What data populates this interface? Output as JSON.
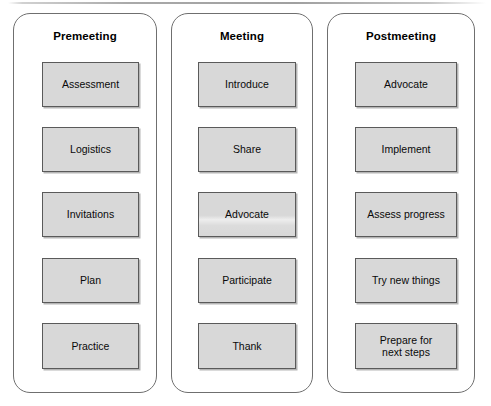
{
  "diagram": {
    "accent_color": "#d8d8d8",
    "border_color": "#5a5a5a",
    "panel_border_color": "#6f6f6f",
    "background_color": "#ffffff",
    "columns": [
      {
        "header": "Premeeting",
        "steps": [
          {
            "label": "Assessment"
          },
          {
            "label": "Logistics"
          },
          {
            "label": "Invitations"
          },
          {
            "label": "Plan"
          },
          {
            "label": "Practice"
          }
        ]
      },
      {
        "header": "Meeting",
        "steps": [
          {
            "label": "Introduce"
          },
          {
            "label": "Share"
          },
          {
            "label": "Advocate"
          },
          {
            "label": "Participate"
          },
          {
            "label": "Thank"
          }
        ]
      },
      {
        "header": "Postmeeting",
        "steps": [
          {
            "label": "Advocate"
          },
          {
            "label": "Implement"
          },
          {
            "label": "Assess progress"
          },
          {
            "label": "Try new things"
          },
          {
            "label": "Prepare for\nnext steps"
          }
        ]
      }
    ]
  }
}
